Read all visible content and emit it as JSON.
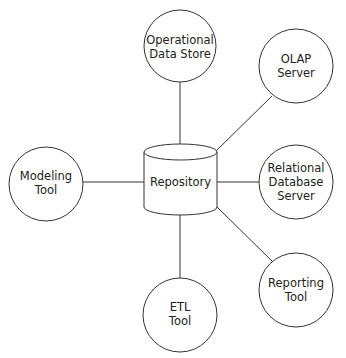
{
  "diagram": {
    "colors": {
      "stroke": "#333333",
      "text": "#222222",
      "background": "#ffffff"
    },
    "hub": {
      "label": "Repository",
      "shape": "cylinder"
    },
    "nodes": [
      {
        "id": "ods",
        "lines": [
          "Operational",
          "Data Store"
        ]
      },
      {
        "id": "olap",
        "lines": [
          "OLAP",
          "Server"
        ]
      },
      {
        "id": "modeling",
        "lines": [
          "Modeling",
          "Tool"
        ]
      },
      {
        "id": "rdbms",
        "lines": [
          "Relational",
          "Database",
          "Server"
        ]
      },
      {
        "id": "etl",
        "lines": [
          "ETL",
          "Tool"
        ]
      },
      {
        "id": "reporting",
        "lines": [
          "Reporting",
          "Tool"
        ]
      }
    ]
  }
}
